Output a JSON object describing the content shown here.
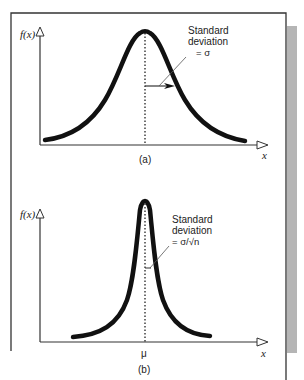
{
  "figure": {
    "frame_color": "#333333",
    "shadow_color": "#b5b5b5",
    "curve_color": "#111111",
    "panels": [
      {
        "id": "a",
        "caption": "(a)",
        "y_axis_label": "f(x)",
        "x_axis_label": "x",
        "annotation_line1": "Standard",
        "annotation_line2": "deviation",
        "annotation_line3": "= σ",
        "description": "Wide normal distribution curve with mean marked by dotted vertical line; horizontal arrow from mean to inflection point shows standard deviation σ"
      },
      {
        "id": "b",
        "caption": "(b)",
        "y_axis_label": "f(x)",
        "x_axis_label": "x",
        "mean_label": "μ",
        "annotation_line1": "Standard",
        "annotation_line2": "deviation",
        "annotation_line3": "= σ/√n",
        "description": "Narrow, tall normal distribution curve (sampling distribution of the mean) centered at μ with standard deviation σ/√n"
      }
    ]
  }
}
